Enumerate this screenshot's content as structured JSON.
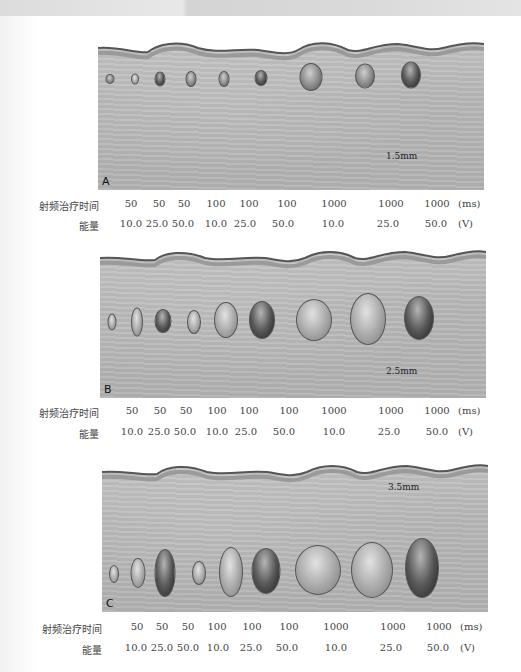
{
  "figure": {
    "row_labels": {
      "time": "射频治疗时间",
      "energy": "能量"
    },
    "units": {
      "time": "(ms)",
      "energy": "(V)"
    },
    "time_values": [
      "50",
      "50",
      "50",
      "100",
      "100",
      "100",
      "1000",
      "1000",
      "1000"
    ],
    "energy_values": [
      "10.0",
      "25.0",
      "50.0",
      "10.0",
      "25.0",
      "50.0",
      "10.0",
      "25.0",
      "50.0"
    ],
    "panels": [
      {
        "label": "A",
        "depth": "1.5mm"
      },
      {
        "label": "B",
        "depth": "2.5mm"
      },
      {
        "label": "C",
        "depth": "3.5mm"
      }
    ]
  }
}
